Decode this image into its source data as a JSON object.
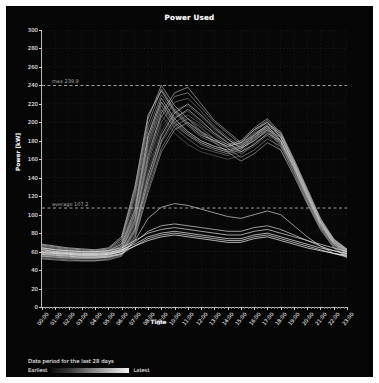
{
  "chart_data": {
    "type": "line",
    "title": "Power Used",
    "xlabel": "Time",
    "ylabel": "Power [kW]",
    "grid": true,
    "legend_position": "bottom-left",
    "ylim": [
      0,
      300
    ],
    "yticks": [
      0,
      20,
      40,
      60,
      80,
      100,
      120,
      140,
      160,
      180,
      200,
      220,
      240,
      260,
      280,
      300
    ],
    "x": [
      "00:00",
      "01:00",
      "02:00",
      "03:00",
      "04:00",
      "05:00",
      "06:00",
      "07:00",
      "08:00",
      "09:00",
      "10:00",
      "11:00",
      "12:00",
      "13:00",
      "14:00",
      "15:00",
      "16:00",
      "17:00",
      "18:00",
      "19:00",
      "20:00",
      "21:00",
      "22:00",
      "23:00"
    ],
    "xticks": [
      "00:00",
      "01:00",
      "02:00",
      "03:00",
      "04:00",
      "05:00",
      "06:00",
      "07:00",
      "08:00",
      "09:00",
      "10:00",
      "11:00",
      "12:00",
      "13:00",
      "14:00",
      "15:00",
      "16:00",
      "17:00",
      "18:00",
      "19:00",
      "20:00",
      "21:00",
      "22:00",
      "23:00"
    ],
    "annotations": [
      {
        "name": "max",
        "label": "max 239.9",
        "value": 239.9,
        "style": "dashed"
      },
      {
        "name": "average",
        "label": "average 107.2",
        "value": 107.2,
        "style": "dashed"
      }
    ],
    "series": [
      {
        "name": "day-01",
        "shade": "#4a4a4a",
        "values": [
          58,
          56,
          55,
          54,
          54,
          55,
          60,
          88,
          150,
          196,
          212,
          204,
          196,
          188,
          180,
          174,
          182,
          196,
          188,
          160,
          128,
          96,
          72,
          60
        ]
      },
      {
        "name": "day-02",
        "shade": "#505050",
        "values": [
          62,
          60,
          58,
          57,
          56,
          58,
          66,
          104,
          176,
          214,
          196,
          186,
          178,
          172,
          168,
          170,
          184,
          192,
          176,
          150,
          118,
          88,
          68,
          58
        ]
      },
      {
        "name": "day-03",
        "shade": "#565656",
        "values": [
          55,
          54,
          53,
          52,
          52,
          54,
          58,
          80,
          138,
          184,
          206,
          212,
          200,
          190,
          178,
          168,
          176,
          188,
          180,
          152,
          120,
          90,
          68,
          56
        ]
      },
      {
        "name": "day-04",
        "shade": "#5c5c5c",
        "values": [
          60,
          58,
          57,
          56,
          56,
          57,
          62,
          96,
          168,
          208,
          188,
          176,
          168,
          164,
          160,
          164,
          178,
          186,
          170,
          144,
          112,
          84,
          66,
          57
        ]
      },
      {
        "name": "day-05",
        "shade": "#626262",
        "values": [
          57,
          56,
          55,
          54,
          54,
          56,
          60,
          86,
          146,
          190,
          214,
          218,
          206,
          192,
          182,
          172,
          180,
          190,
          182,
          154,
          122,
          92,
          70,
          58
        ]
      },
      {
        "name": "day-06",
        "shade": "#686868",
        "values": [
          64,
          62,
          60,
          59,
          58,
          60,
          68,
          112,
          186,
          222,
          202,
          190,
          180,
          174,
          170,
          172,
          186,
          196,
          180,
          152,
          120,
          90,
          70,
          60
        ]
      },
      {
        "name": "day-07",
        "shade": "#6e6e6e",
        "values": [
          54,
          53,
          52,
          51,
          51,
          53,
          57,
          78,
          132,
          178,
          200,
          208,
          198,
          186,
          176,
          166,
          174,
          186,
          178,
          150,
          118,
          88,
          66,
          55
        ]
      },
      {
        "name": "day-08",
        "shade": "#747474",
        "values": [
          61,
          59,
          58,
          57,
          57,
          58,
          64,
          98,
          172,
          214,
          194,
          182,
          172,
          168,
          164,
          168,
          182,
          190,
          174,
          146,
          114,
          86,
          67,
          58
        ]
      },
      {
        "name": "day-09",
        "shade": "#7a7a7a",
        "values": [
          58,
          57,
          56,
          55,
          55,
          56,
          61,
          90,
          156,
          200,
          222,
          226,
          212,
          196,
          184,
          174,
          182,
          194,
          186,
          156,
          124,
          94,
          72,
          60
        ]
      },
      {
        "name": "day-10",
        "shade": "#808080",
        "values": [
          65,
          63,
          61,
          60,
          59,
          61,
          70,
          118,
          192,
          230,
          210,
          196,
          184,
          178,
          172,
          176,
          190,
          200,
          184,
          154,
          122,
          92,
          71,
          61
        ]
      },
      {
        "name": "day-11",
        "shade": "#868686",
        "values": [
          53,
          52,
          51,
          50,
          50,
          52,
          56,
          76,
          128,
          172,
          196,
          204,
          194,
          182,
          172,
          162,
          170,
          182,
          174,
          146,
          114,
          86,
          65,
          54
        ]
      },
      {
        "name": "day-12",
        "shade": "#8c8c8c",
        "values": [
          62,
          60,
          59,
          58,
          58,
          59,
          65,
          100,
          178,
          218,
          198,
          186,
          176,
          170,
          166,
          170,
          184,
          192,
          176,
          148,
          116,
          87,
          68,
          59
        ]
      },
      {
        "name": "day-13",
        "shade": "#929292",
        "values": [
          59,
          58,
          57,
          56,
          56,
          57,
          62,
          92,
          160,
          206,
          228,
          232,
          216,
          200,
          188,
          176,
          184,
          196,
          188,
          158,
          126,
          95,
          73,
          61
        ]
      },
      {
        "name": "day-14",
        "shade": "#989898",
        "values": [
          66,
          64,
          62,
          61,
          60,
          62,
          72,
          122,
          198,
          236,
          214,
          200,
          188,
          180,
          174,
          178,
          192,
          202,
          186,
          156,
          124,
          93,
          72,
          62
        ]
      },
      {
        "name": "day-15",
        "shade": "#9e9e9e",
        "values": [
          52,
          51,
          50,
          50,
          50,
          51,
          55,
          74,
          124,
          168,
          192,
          200,
          190,
          178,
          168,
          158,
          166,
          178,
          170,
          142,
          112,
          84,
          64,
          53
        ]
      },
      {
        "name": "day-16",
        "shade": "#a4a4a4",
        "values": [
          63,
          61,
          60,
          59,
          59,
          60,
          66,
          102,
          182,
          222,
          200,
          188,
          178,
          172,
          168,
          172,
          186,
          194,
          178,
          150,
          118,
          88,
          69,
          60
        ]
      },
      {
        "name": "day-17",
        "shade": "#aaaaaa",
        "values": [
          60,
          59,
          58,
          57,
          57,
          58,
          63,
          94,
          164,
          210,
          232,
          238,
          220,
          202,
          190,
          178,
          186,
          198,
          190,
          160,
          128,
          96,
          74,
          62
        ]
      },
      {
        "name": "day-18",
        "shade": "#b0b0b0",
        "values": [
          67,
          65,
          63,
          62,
          61,
          63,
          74,
          126,
          204,
          240,
          218,
          204,
          190,
          182,
          176,
          180,
          194,
          204,
          188,
          158,
          126,
          94,
          73,
          63
        ]
      },
      {
        "name": "day-19",
        "shade": "#b6b6b6",
        "values": [
          56,
          55,
          54,
          53,
          53,
          54,
          58,
          82,
          136,
          180,
          204,
          214,
          202,
          188,
          178,
          168,
          176,
          188,
          180,
          152,
          120,
          90,
          68,
          57
        ]
      },
      {
        "name": "day-20",
        "shade": "#bcbcbc",
        "values": [
          64,
          62,
          61,
          60,
          60,
          61,
          68,
          106,
          186,
          226,
          204,
          190,
          180,
          174,
          170,
          174,
          188,
          196,
          180,
          152,
          120,
          90,
          70,
          61
        ]
      },
      {
        "name": "day-21",
        "shade": "#c2c2c2",
        "values": [
          58,
          57,
          56,
          55,
          55,
          56,
          60,
          84,
          142,
          186,
          210,
          220,
          208,
          194,
          182,
          172,
          180,
          192,
          184,
          154,
          122,
          92,
          70,
          59
        ]
      },
      {
        "name": "day-22",
        "shade": "#c8c8c8",
        "values": [
          68,
          66,
          64,
          63,
          62,
          64,
          76,
          130,
          208,
          234,
          212,
          198,
          186,
          180,
          174,
          178,
          192,
          200,
          184,
          156,
          124,
          92,
          72,
          62
        ]
      },
      {
        "name": "day-23",
        "shade": "#d0d0d0",
        "values": [
          55,
          54,
          53,
          53,
          53,
          54,
          57,
          72,
          96,
          108,
          112,
          110,
          106,
          102,
          98,
          96,
          100,
          104,
          100,
          88,
          76,
          66,
          58,
          54
        ]
      },
      {
        "name": "day-24",
        "shade": "#d8d8d8",
        "values": [
          60,
          59,
          58,
          57,
          57,
          58,
          61,
          70,
          82,
          88,
          90,
          88,
          86,
          84,
          82,
          82,
          86,
          88,
          84,
          78,
          72,
          66,
          61,
          57
        ]
      },
      {
        "name": "day-25",
        "shade": "#e0e0e0",
        "values": [
          64,
          62,
          61,
          60,
          60,
          61,
          64,
          72,
          80,
          84,
          86,
          84,
          82,
          80,
          78,
          78,
          82,
          84,
          80,
          76,
          72,
          68,
          64,
          60
        ]
      },
      {
        "name": "day-26",
        "shade": "#e8e8e8",
        "values": [
          57,
          56,
          55,
          54,
          54,
          55,
          58,
          66,
          74,
          78,
          80,
          78,
          76,
          74,
          72,
          72,
          76,
          78,
          74,
          70,
          66,
          62,
          58,
          55
        ]
      },
      {
        "name": "day-27",
        "shade": "#f0f0f0",
        "values": [
          62,
          60,
          59,
          58,
          58,
          59,
          62,
          68,
          76,
          80,
          82,
          80,
          78,
          76,
          74,
          74,
          78,
          80,
          76,
          72,
          68,
          64,
          61,
          58
        ]
      },
      {
        "name": "day-28",
        "shade": "#fafafa",
        "values": [
          59,
          58,
          57,
          56,
          56,
          57,
          60,
          66,
          72,
          76,
          78,
          76,
          74,
          72,
          70,
          70,
          74,
          76,
          72,
          68,
          64,
          61,
          58,
          56
        ]
      }
    ]
  },
  "footer": {
    "caption": "Data period for the last 28 days",
    "earliest_label": "Earliest",
    "latest_label": "Latest"
  }
}
